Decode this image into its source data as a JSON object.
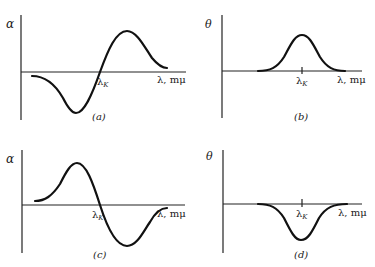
{
  "figure": {
    "panels": [
      {
        "id": "a",
        "caption": "(a)",
        "y_label": "α",
        "x_label": "λ, mμ",
        "marker_label": "λK",
        "marker_main": "λ",
        "marker_sub": "K",
        "curve": "dispersive: negative trough below λK, crosses zero at λK, positive peak above λK"
      },
      {
        "id": "b",
        "caption": "(b)",
        "y_label": "θ",
        "x_label": "λ, mμ",
        "marker_label": "λK",
        "marker_main": "λ",
        "marker_sub": "K",
        "curve": "positive Gaussian band centered at λK"
      },
      {
        "id": "c",
        "caption": "(c)",
        "y_label": "α",
        "x_label": "λ, mμ",
        "marker_label": "λK",
        "marker_main": "λ",
        "marker_sub": "K",
        "curve": "dispersive: positive peak below λK, crosses zero at λK, negative trough above λK"
      },
      {
        "id": "d",
        "caption": "(d)",
        "y_label": "θ",
        "x_label": "λ, mμ",
        "marker_label": "λK",
        "marker_main": "λ",
        "marker_sub": "K",
        "curve": "negative Gaussian band centered at λK"
      }
    ]
  }
}
